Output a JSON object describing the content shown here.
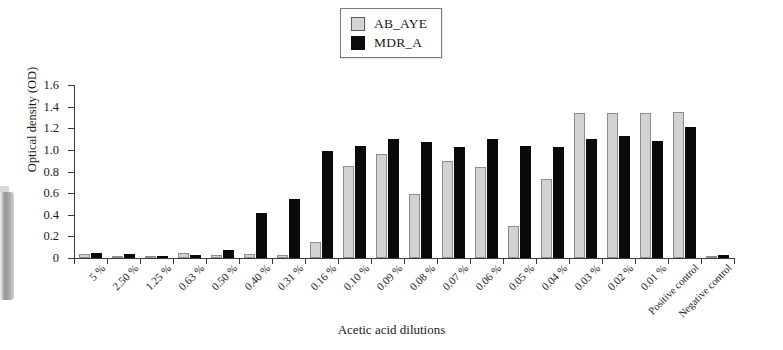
{
  "chart_data": {
    "type": "bar",
    "title": "",
    "xlabel": "Acetic acid dilutions",
    "ylabel": "Optical density (OD)",
    "ylim": [
      0,
      1.6
    ],
    "ytick_labels": [
      "0",
      "0.2",
      "0.4",
      "0.6",
      "0.8",
      "1.0",
      "1.2",
      "1.4",
      "1.6"
    ],
    "ytick_values": [
      0,
      0.2,
      0.4,
      0.6,
      0.8,
      1.0,
      1.2,
      1.4,
      1.6
    ],
    "grid": false,
    "legend_position": "top-center",
    "categories": [
      "5 %",
      "2.50 %",
      "1.25 %",
      "0.63 %",
      "0.50 %",
      "0.40 %",
      "0.31 %",
      "0.16 %",
      "0.10 %",
      "0.09 %",
      "0.08 %",
      "0.07 %",
      "0.06 %",
      "0.05 %",
      "0.04 %",
      "0.03 %",
      "0.02 %",
      "0.01 %",
      "Positive control",
      "Negative control"
    ],
    "series": [
      {
        "name": "AB_AYE",
        "color": "#d2d2d2",
        "values": [
          0.04,
          0.02,
          0.02,
          0.05,
          0.03,
          0.04,
          0.03,
          0.15,
          0.85,
          0.96,
          0.59,
          0.9,
          0.84,
          0.3,
          0.73,
          1.34,
          1.34,
          1.34,
          1.35,
          0.01
        ]
      },
      {
        "name": "MDR_A",
        "color": "#0a0a0a",
        "values": [
          0.05,
          0.04,
          0.02,
          0.03,
          0.07,
          0.42,
          0.55,
          0.99,
          1.04,
          1.1,
          1.07,
          1.03,
          1.1,
          1.04,
          1.03,
          1.1,
          1.13,
          1.08,
          1.21,
          0.03
        ]
      }
    ]
  },
  "legend": {
    "items": [
      {
        "label": "AB_AYE",
        "swatch": "gray-square-icon"
      },
      {
        "label": "MDR_A",
        "swatch": "black-square-icon"
      }
    ]
  }
}
